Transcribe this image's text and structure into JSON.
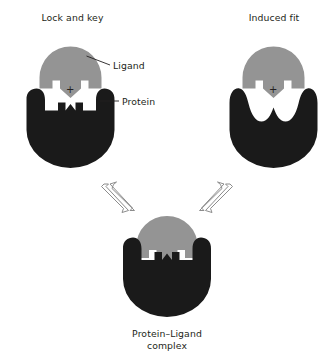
{
  "figure": {
    "type": "diagram",
    "background_color": "#ffffff",
    "colors": {
      "ligand": "#949494",
      "protein": "#1a1a1a",
      "text": "#231f20",
      "arrow_stroke": "#8c8c8c"
    }
  },
  "panels": {
    "left": {
      "title": "Lock and key",
      "plus": "+",
      "ligand_shape": "dome-with-notched-prongs",
      "protein_shape": "rounded-blob-with-complementary-notched-top"
    },
    "right": {
      "title": "Induced fit",
      "plus": "+",
      "ligand_shape": "dome-with-notched-prongs",
      "protein_shape": "rounded-blob-with-smooth-wavy-top"
    }
  },
  "annotations": {
    "ligand_label": "Ligand",
    "protein_label": "Protein"
  },
  "product": {
    "caption_line1": "Protein–Ligand",
    "caption_line2": "complex",
    "caption_full": "Protein–Ligand complex"
  },
  "arrows": {
    "left_equilibrium": "double-headed-equilibrium-arrow",
    "right_equilibrium": "double-headed-equilibrium-arrow"
  }
}
